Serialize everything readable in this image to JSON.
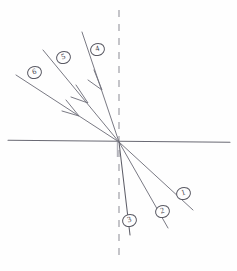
{
  "figure": {
    "kind": "hand-drawn-optics-ray-diagram",
    "title": "",
    "ink_color": "#6a6a74",
    "dash_color": "#9a9aa2",
    "paper_color": "#fefefe",
    "origin": {
      "x": 119,
      "y": 142
    },
    "interface_line": {
      "name": "horizontal-boundary",
      "x1": 8,
      "y1": 140,
      "x2": 230,
      "y2": 142,
      "style": "solid"
    },
    "normal_line": {
      "name": "vertical-dashed-normal",
      "x1": 119,
      "y1": 10,
      "x2": 119,
      "y2": 262,
      "style": "dashed"
    },
    "incoming_rays": [
      {
        "label": "6",
        "name": "incoming-ray-6",
        "x1": 16,
        "y1": 75,
        "x2": 119,
        "y2": 142,
        "arrow": true,
        "arrow_at": {
          "x": 74,
          "y": 112
        },
        "label_pos": {
          "x": 27,
          "y": 66
        }
      },
      {
        "label": "5",
        "name": "incoming-ray-5",
        "x1": 43,
        "y1": 50,
        "x2": 119,
        "y2": 142,
        "arrow": true,
        "arrow_at": {
          "x": 83,
          "y": 98
        },
        "label_pos": {
          "x": 56,
          "y": 51
        }
      },
      {
        "label": "4",
        "name": "incoming-ray-4",
        "x1": 82,
        "y1": 32,
        "x2": 119,
        "y2": 142,
        "arrow": true,
        "arrow_at": {
          "x": 101,
          "y": 87
        },
        "label_pos": {
          "x": 90,
          "y": 43
        }
      }
    ],
    "outgoing_rays": [
      {
        "label": "1",
        "name": "outgoing-ray-1",
        "x1": 119,
        "y1": 142,
        "x2": 193,
        "y2": 210,
        "arrow": false,
        "label_pos": {
          "x": 176,
          "y": 187
        }
      },
      {
        "label": "2",
        "name": "outgoing-ray-2",
        "x1": 119,
        "y1": 142,
        "x2": 168,
        "y2": 228,
        "arrow": false,
        "label_pos": {
          "x": 155,
          "y": 205
        }
      },
      {
        "label": "3",
        "name": "outgoing-ray-3",
        "x1": 119,
        "y1": 142,
        "x2": 130,
        "y2": 235,
        "arrow": false,
        "label_pos": {
          "x": 122,
          "y": 214
        }
      }
    ]
  }
}
